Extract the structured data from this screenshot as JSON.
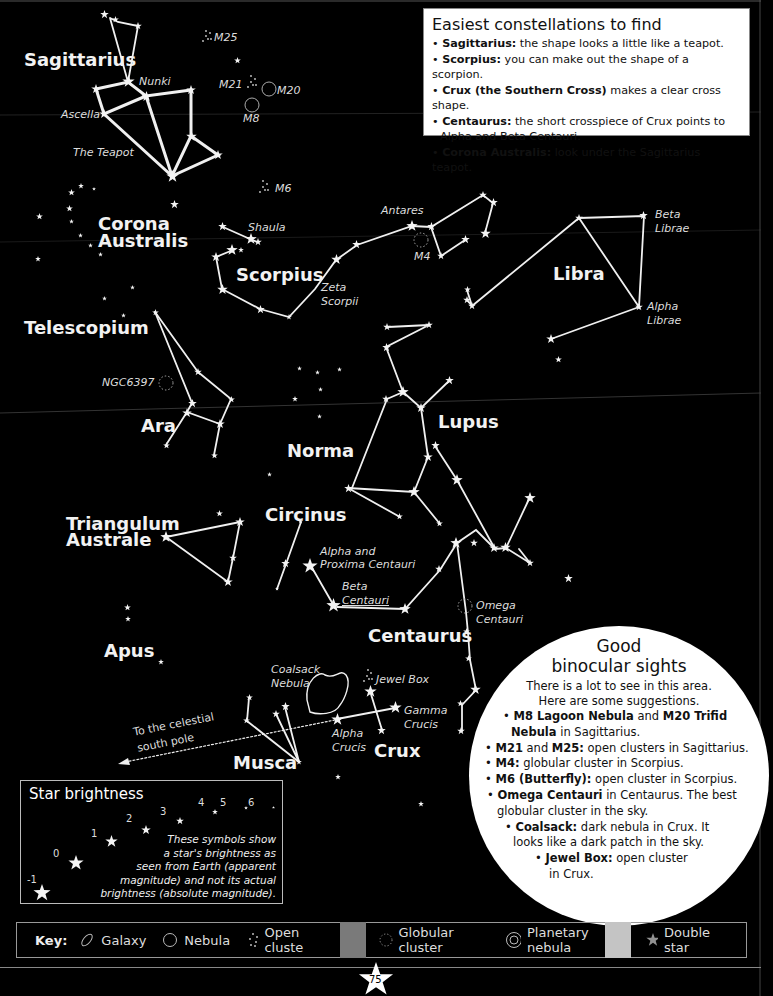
{
  "info_box": {
    "title": "Easiest constellations to find",
    "items": [
      {
        "bold": "Sagittarius:",
        "text": " the shape looks a little like a teapot."
      },
      {
        "bold": "Scorpius:",
        "text": " you can make out the shape of a scorpion."
      },
      {
        "bold": "Crux (the Southern Cross)",
        "text": " makes a clear cross shape."
      },
      {
        "bold": "Centaurus:",
        "text": " the short crosspiece of Crux points to"
      },
      {
        "bold": "",
        "text": "Alpha and Beta Centauri."
      },
      {
        "bold": "Corona Australis:",
        "text": " look under the Sagittarius teapot."
      }
    ]
  },
  "constellations": {
    "sagittarius": "Sagittarius",
    "corona_australis_1": "Corona",
    "corona_australis_2": "Australis",
    "scorpius": "Scorpius",
    "libra": "Libra",
    "telescopium": "Telescopium",
    "ara": "Ara",
    "norma": "Norma",
    "lupus": "Lupus",
    "triangulum_australe_1": "Triangulum",
    "triangulum_australe_2": "Australe",
    "circinus": "Circinus",
    "centaurus": "Centaurus",
    "apus": "Apus",
    "musca": "Musca",
    "crux": "Crux"
  },
  "star_labels": {
    "nunki": "Nunki",
    "ascella": "Ascella",
    "teapot": "The Teapot",
    "m25": "M25",
    "m21": "M21",
    "m20": "M20",
    "m8": "M8",
    "m6": "M6",
    "shaula": "Shaula",
    "antares": "Antares",
    "m4": "M4",
    "zeta_scorpii_1": "Zeta",
    "zeta_scorpii_2": "Scorpii",
    "beta_librae_1": "Beta",
    "beta_librae_2": "Librae",
    "alpha_librae_1": "Alpha",
    "alpha_librae_2": "Librae",
    "ngc6397": "NGC6397",
    "alpha_proxima_1": "Alpha and",
    "alpha_proxima_2": "Proxima Centauri",
    "beta_centauri_1": "Beta",
    "beta_centauri_2": "Centauri",
    "omega_centauri_1": "Omega",
    "omega_centauri_2": "Centauri",
    "coalsack_1": "Coalsack",
    "coalsack_2": "Nebula",
    "jewel_box": "Jewel Box",
    "gamma_crucis_1": "Gamma",
    "gamma_crucis_2": "Crucis",
    "alpha_crucis_1": "Alpha",
    "alpha_crucis_2": "Crucis",
    "pole_1": "To the celestial",
    "pole_2": "south pole"
  },
  "binocular": {
    "title_1": "Good",
    "title_2": "binocular sights",
    "intro_1": "There is a lot to see in this area.",
    "intro_2": "Here are some suggestions.",
    "items": [
      {
        "b1": "M8 Lagoon Nebula",
        "t1": " and ",
        "b2": "M20 Trifid",
        "t2": ""
      },
      {
        "b1": "Nebula",
        "t1": " in Sagittarius.",
        "b2": "",
        "t2": ""
      },
      {
        "b1": "M21",
        "t1": " and ",
        "b2": "M25:",
        "t2": " open clusters in Sagittarius."
      },
      {
        "b1": "M4:",
        "t1": " globular cluster in Scorpius.",
        "b2": "",
        "t2": ""
      },
      {
        "b1": "M6 (Butterfly):",
        "t1": " open cluster in Scorpius.",
        "b2": "",
        "t2": ""
      },
      {
        "b1": "Omega Centauri",
        "t1": " in Centaurus. The best",
        "b2": "",
        "t2": ""
      },
      {
        "b1": "",
        "t1": "globular cluster in the sky.",
        "b2": "",
        "t2": ""
      },
      {
        "b1": "Coalsack:",
        "t1": " dark nebula in Crux. It",
        "b2": "",
        "t2": ""
      },
      {
        "b1": "",
        "t1": "looks like a dark patch in the sky.",
        "b2": "",
        "t2": ""
      },
      {
        "b1": "Jewel Box:",
        "t1": " open cluster",
        "b2": "",
        "t2": ""
      },
      {
        "b1": "",
        "t1": "in Crux.",
        "b2": "",
        "t2": ""
      }
    ]
  },
  "brightness": {
    "title": "Star brightness",
    "magnitudes": [
      "-1",
      "0",
      "1",
      "2",
      "3",
      "4",
      "5",
      "6"
    ],
    "desc": [
      "These symbols show",
      "a star's brightness as",
      "seen from Earth (apparent",
      "magnitude) and not its actual",
      "brightness (absolute magnitude)."
    ]
  },
  "key": {
    "label": "Key:",
    "items": [
      {
        "icon": "galaxy-icon",
        "label": "Galaxy"
      },
      {
        "icon": "nebula-icon",
        "label": "Nebula"
      },
      {
        "icon": "open-cluster-icon",
        "label": "Open cluste"
      },
      {
        "icon": "globular-cluster-icon",
        "label": "Globular cluster"
      },
      {
        "icon": "planetary-nebula-icon",
        "label": "Planetary nebula"
      },
      {
        "icon": "double-star-icon",
        "label": "Double star"
      }
    ]
  },
  "page_number": "75"
}
